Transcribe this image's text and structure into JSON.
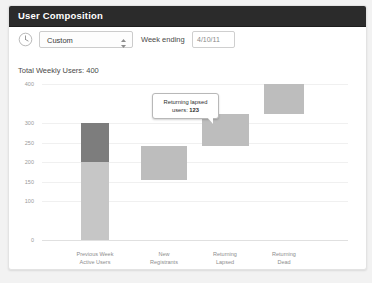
{
  "panel": {
    "title": "User Composition"
  },
  "toolbar": {
    "clock_icon": "clock-icon",
    "period_value": "Custom",
    "spinner_icon": "stepper-updown-icon",
    "week_ending_label": "Week ending",
    "date_value": "4/10/11"
  },
  "summary": {
    "total_weekly_users": "Total Weekly Users: 400"
  },
  "tooltip": {
    "line1": "Returning lapsed",
    "line2_prefix": "users: ",
    "value": "123"
  },
  "colors": {
    "panel_background": "#ffffff",
    "page_background": "#f2f2f2",
    "titlebar": "#2b2b2b",
    "bar_dark": "#7d7d7d",
    "bar_light": "#c6c6c6",
    "bar_mid": "#bdbdbd",
    "axis_text": "#9a9a9a",
    "gridline": "#f0f0f0"
  },
  "chart_data": {
    "type": "bar",
    "subtype": "waterfall",
    "title": "",
    "xlabel": "",
    "ylabel": "",
    "ylim": [
      0,
      400
    ],
    "grid": true,
    "legend": "none",
    "yticks": [
      0,
      100,
      150,
      200,
      250,
      300,
      400
    ],
    "ytick_labels": [
      "0",
      "100",
      "150",
      "200",
      "250",
      "300",
      "400"
    ],
    "categories": [
      "Previous Week\nActive Users",
      "New\nRegistrants",
      "Returning\nLapsed",
      "Returning\nDead"
    ],
    "bars": [
      {
        "category": "Previous Week\nActive Users",
        "base": 0,
        "top": 300,
        "segments": [
          {
            "name": "retained",
            "from": 0,
            "to": 200,
            "color": "#c6c6c6"
          },
          {
            "name": "churned",
            "from": 200,
            "to": 300,
            "color": "#7d7d7d"
          }
        ]
      },
      {
        "category": "New\nRegistrants",
        "base": 155,
        "top": 240,
        "value": 85,
        "color": "#bdbdbd"
      },
      {
        "category": "Returning\nLapsed",
        "base": 240,
        "top": 323,
        "value": 123,
        "color": "#bdbdbd"
      },
      {
        "category": "Returning\nDead",
        "base": 323,
        "top": 400,
        "value": 77,
        "color": "#bdbdbd"
      }
    ]
  }
}
